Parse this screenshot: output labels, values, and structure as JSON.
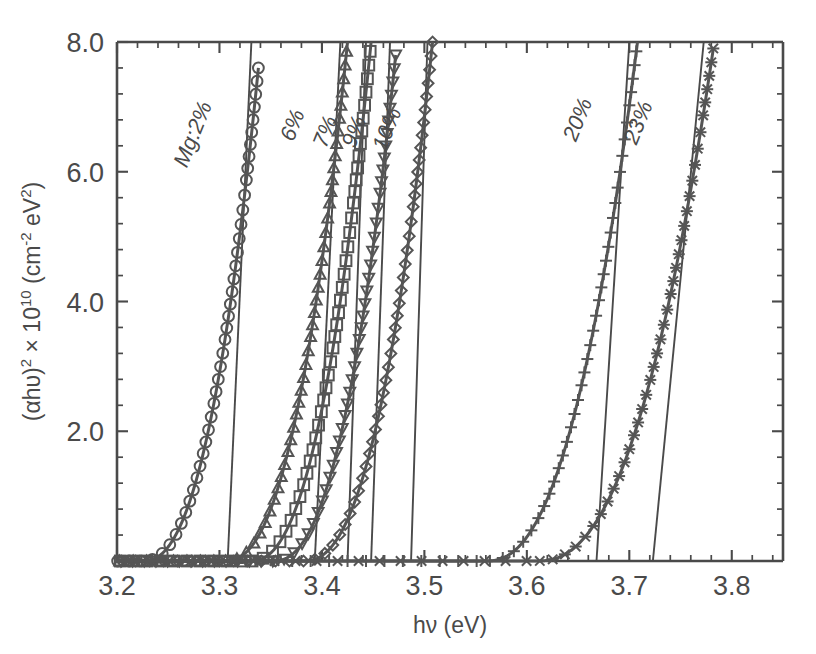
{
  "figure": {
    "name": "tauc-plot-mg-doped",
    "background": "#ffffff",
    "ink_color": "#4a4a4a",
    "curve_color": "#555555"
  },
  "chart_data": {
    "type": "line",
    "title": "",
    "subtitle": "",
    "xlabel": "hν (eV)",
    "ylabel": "(αhυ)² × 10¹⁰  (cm⁻² eV²)",
    "ylabel_parts": {
      "base1": "(αhυ)",
      "sup1": "2",
      "times": "× 10",
      "sup2": "10",
      "unit_open": "(cm",
      "unit_sup": "-2",
      "unit_rest": " eV",
      "unit_sup2": "2",
      "unit_close": ")"
    },
    "xlim": [
      3.2,
      3.85
    ],
    "ylim": [
      0.0,
      8.0
    ],
    "grid": false,
    "legend_position": "inline-curve-labels",
    "xticks": [
      3.2,
      3.3,
      3.4,
      3.5,
      3.6,
      3.7,
      3.8
    ],
    "xticklabels": [
      "3.2",
      "3.3",
      "3.4",
      "3.5",
      "3.6",
      "3.7",
      "3.8"
    ],
    "x_minor_step": 0.02,
    "yticks": [
      2.0,
      4.0,
      6.0,
      8.0
    ],
    "yticklabels": [
      "2.0",
      "4.0",
      "6.0",
      "8.0"
    ],
    "y_minor_step": 0.4,
    "series": [
      {
        "name": "Mg:2%",
        "label": "Mg:2%",
        "marker": "circle",
        "onset": 3.225,
        "tangent_x0": 3.308,
        "tangent_x1": 3.33,
        "top_value": 7.6,
        "curve_x_at_top": 3.338,
        "label_x": 3.268,
        "label_y": 6.05
      },
      {
        "name": "6%",
        "label": "6%",
        "marker": "triangle-up",
        "onset": 3.305,
        "tangent_x0": 3.393,
        "tangent_x1": 3.418,
        "top_value": 8.0,
        "curve_x_at_top": 3.425,
        "label_x": 3.372,
        "label_y": 6.45
      },
      {
        "name": "7%",
        "label": "7%",
        "marker": "square",
        "onset": 3.33,
        "tangent_x0": 3.425,
        "tangent_x1": 3.443,
        "top_value": 8.0,
        "curve_x_at_top": 3.448,
        "label_x": 3.404,
        "label_y": 6.35
      },
      {
        "name": "9%",
        "label": "9%",
        "marker": "triangle-down",
        "onset": 3.352,
        "tangent_x0": 3.448,
        "tangent_x1": 3.466,
        "top_value": 7.8,
        "curve_x_at_top": 3.472,
        "label_x": 3.432,
        "label_y": 6.35
      },
      {
        "name": "10%",
        "label": "10%",
        "marker": "diamond",
        "onset": 3.382,
        "tangent_x0": 3.487,
        "tangent_x1": 3.503,
        "top_value": 8.0,
        "curve_x_at_top": 3.508,
        "label_x": 3.462,
        "label_y": 6.3
      },
      {
        "name": "20%",
        "label": "20%",
        "marker": "plus",
        "onset": 3.56,
        "tangent_x0": 3.668,
        "tangent_x1": 3.7,
        "top_value": 8.0,
        "curve_x_at_top": 3.708,
        "label_x": 3.648,
        "label_y": 6.45
      },
      {
        "name": "23%",
        "label": "23%",
        "marker": "cross",
        "onset": 3.61,
        "tangent_x0": 3.723,
        "tangent_x1": 3.772,
        "top_value": 7.9,
        "curve_x_at_top": 3.782,
        "label_x": 3.707,
        "label_y": 6.4
      }
    ]
  }
}
